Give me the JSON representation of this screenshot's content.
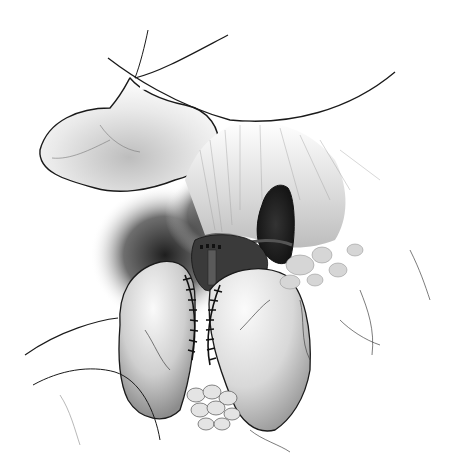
{
  "illustration": {
    "subject": "surgical-anatomy-drawing",
    "style": "grayscale pencil illustration",
    "width": 457,
    "height": 473,
    "colors": {
      "background": "#ffffff",
      "line": "#1a1a1a",
      "shadow": "#2b2b2b",
      "midtone": "#8a8a8a",
      "highlight": "#f2f2f2"
    }
  }
}
